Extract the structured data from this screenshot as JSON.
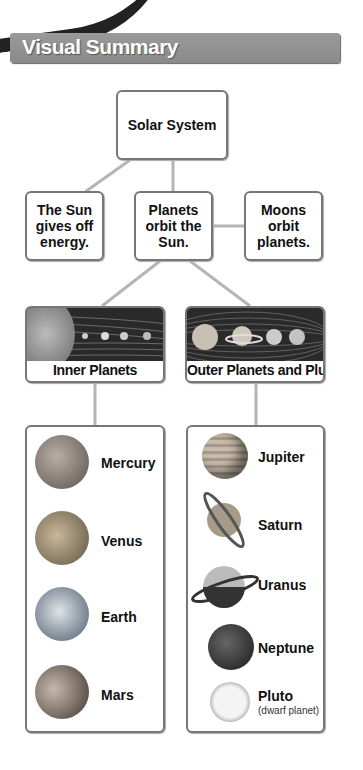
{
  "corner_banner": {
    "text": "Lo"
  },
  "header": {
    "title": "Visual Summary"
  },
  "diagram": {
    "root": {
      "label": "Solar System"
    },
    "level2": [
      {
        "label": "The Sun\ngives off\nenergy."
      },
      {
        "label": "Planets\norbit the\nSun."
      },
      {
        "label": "Moons\norbit\nplanets."
      }
    ],
    "groups": [
      {
        "label": "Inner Planets",
        "planets": [
          {
            "name": "Mercury",
            "color": "#8a8078"
          },
          {
            "name": "Venus",
            "color": "#9a8a70"
          },
          {
            "name": "Earth",
            "color": "#6f7f8f"
          },
          {
            "name": "Mars",
            "color": "#8a7a70"
          }
        ]
      },
      {
        "label": "Outer Planets and Pluto",
        "planets": [
          {
            "name": "Jupiter",
            "color": "#a89a88"
          },
          {
            "name": "Saturn",
            "color": "#9a8c7a"
          },
          {
            "name": "Uranus",
            "color": "#8f8f8f"
          },
          {
            "name": "Neptune",
            "color": "#3a3a3a"
          },
          {
            "name": "Pluto",
            "subtitle": "(dwarf planet)",
            "color": "#e8e8e8"
          }
        ]
      }
    ]
  }
}
